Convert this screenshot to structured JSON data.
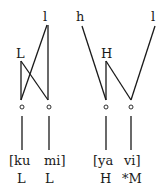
{
  "diagram": {
    "left": {
      "tiers": {
        "high_register": "l",
        "tone": "L"
      },
      "syllables": [
        "[ku",
        "mi]"
      ],
      "tones": [
        "L",
        "L"
      ]
    },
    "right": {
      "tiers": {
        "register_left": "h",
        "register_right": "l",
        "tone": "H"
      },
      "syllables": [
        "[ya",
        "vi]"
      ],
      "tones": [
        "H",
        "*M"
      ]
    }
  }
}
